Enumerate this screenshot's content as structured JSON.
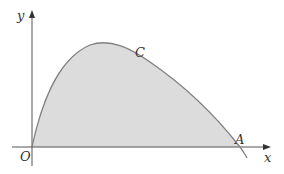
{
  "diagram": {
    "axes": {
      "x_label": "x",
      "y_label": "y",
      "origin_label": "O"
    },
    "curve_label": "C",
    "point_label": "A",
    "colors": {
      "axis": "#555555",
      "curve": "#808080",
      "fill": "#dcdcdc",
      "text": "#333333"
    }
  }
}
